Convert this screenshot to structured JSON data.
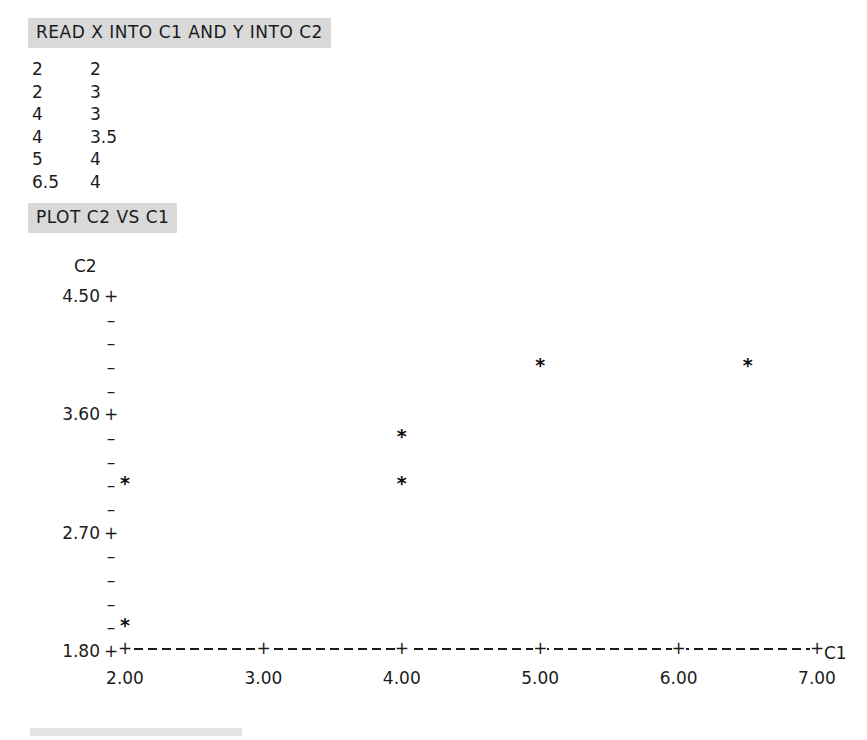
{
  "commands": {
    "read": "READ X INTO C1 AND Y INTO C2",
    "plot": "PLOT C2 VS C1"
  },
  "data_table": {
    "rows": [
      {
        "x": "2",
        "y": "2"
      },
      {
        "x": "2",
        "y": "3"
      },
      {
        "x": "4",
        "y": "3"
      },
      {
        "x": "4",
        "y": "3.5"
      },
      {
        "x": "5",
        "y": "4"
      },
      {
        "x": "6.5",
        "y": "4"
      }
    ]
  },
  "chart_data": {
    "type": "scatter",
    "title": "",
    "xlabel": "C1",
    "ylabel": "C2",
    "x": [
      2,
      2,
      4,
      4,
      5,
      6.5
    ],
    "y": [
      2,
      3,
      3,
      3.5,
      4,
      4
    ],
    "points": [
      {
        "x": 2,
        "y": 2
      },
      {
        "x": 2,
        "y": 3
      },
      {
        "x": 4,
        "y": 3
      },
      {
        "x": 4,
        "y": 3.5
      },
      {
        "x": 5,
        "y": 4
      },
      {
        "x": 6.5,
        "y": 4
      }
    ],
    "marker": "*",
    "xlim": [
      2.0,
      7.0
    ],
    "ylim": [
      1.8,
      4.5
    ],
    "xticks": [
      "2.00",
      "3.00",
      "4.00",
      "5.00",
      "6.00",
      "7.00"
    ],
    "xtick_values": [
      2.0,
      3.0,
      4.0,
      5.0,
      6.0,
      7.0
    ],
    "yticks": [
      "4.50",
      "3.60",
      "2.70",
      "1.80"
    ],
    "ytick_values": [
      4.5,
      3.6,
      2.7,
      1.8
    ],
    "y_row_step": 0.18,
    "y_rows": 16,
    "grid": false,
    "legend": null,
    "axis_style": "ascii-character-plot"
  },
  "plot_axes": {
    "y_title": "C2",
    "x_title": "C1",
    "y_rows": [
      {
        "label": "4.50",
        "tick": "+"
      },
      {
        "label": "",
        "tick": "–"
      },
      {
        "label": "",
        "tick": "–"
      },
      {
        "label": "",
        "tick": "–"
      },
      {
        "label": "",
        "tick": "–"
      },
      {
        "label": "3.60",
        "tick": "+"
      },
      {
        "label": "",
        "tick": "–"
      },
      {
        "label": "",
        "tick": "–"
      },
      {
        "label": "",
        "tick": "–"
      },
      {
        "label": "",
        "tick": "–"
      },
      {
        "label": "2.70",
        "tick": "+"
      },
      {
        "label": "",
        "tick": "–"
      },
      {
        "label": "",
        "tick": "–"
      },
      {
        "label": "",
        "tick": "–"
      },
      {
        "label": "",
        "tick": "–"
      },
      {
        "label": "1.80",
        "tick": "+"
      }
    ],
    "x_ticks": [
      "2.00",
      "3.00",
      "4.00",
      "5.00",
      "6.00",
      "7.00"
    ],
    "tick_glyph": "+",
    "dash_glyph": "-",
    "marker_glyph": "*"
  },
  "colors": {
    "command_highlight": "#d9d9d9",
    "text": "#1b1b1b",
    "background": "#ffffff",
    "bottom_strip": "#dedede"
  }
}
